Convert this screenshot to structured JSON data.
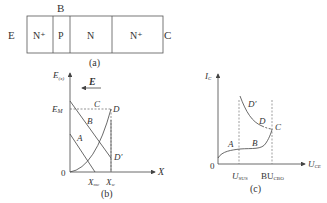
{
  "panel_a": {
    "caption": "(a)",
    "left_terminal": "E",
    "right_terminal": "C",
    "base_terminal": "B",
    "regions": [
      "N⁺",
      "P",
      "N",
      "N⁺"
    ]
  },
  "panel_b": {
    "caption": "(b)",
    "y_axis_label": "E",
    "y_axis_sub": "(x)",
    "x_axis_label": "X",
    "origin": "0",
    "field_label": "E",
    "em_label": "E",
    "em_sub": "M",
    "xmc_label": "X",
    "xmc_sub": "mc",
    "xw_label": "X",
    "xw_sub": "w",
    "points": {
      "A": "A",
      "B": "B",
      "C": "C",
      "D": "D",
      "Dp": "D′"
    }
  },
  "panel_c": {
    "caption": "(c)",
    "y_axis_label": "I",
    "y_axis_sub": "C",
    "x_axis_label": "U",
    "x_axis_sub": "CE",
    "origin": "0",
    "usus_label": "U",
    "usus_sub": "SUS",
    "bu_label": "BU",
    "bu_sub": "CBO",
    "points": {
      "A": "A",
      "B": "B",
      "C": "C",
      "D": "D",
      "Dp": "D′"
    }
  },
  "colors": {
    "line": "#555555",
    "text": "#333333"
  }
}
